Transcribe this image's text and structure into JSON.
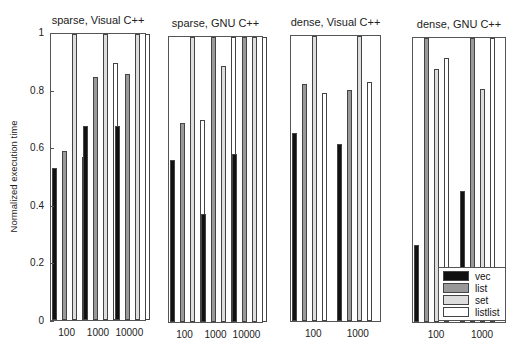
{
  "chart_data": [
    {
      "type": "bar",
      "title": "sparse, Visual C++",
      "ylabel": "Normalized execution time",
      "ylim": [
        0,
        1
      ],
      "yticks": [
        "0",
        "0.2",
        "0.4",
        "0.6",
        "0.8",
        "1"
      ],
      "categories": [
        "100",
        "1000",
        "10000"
      ],
      "series": [
        {
          "name": "vec",
          "values": [
            0.53,
            0.68,
            0.68
          ]
        },
        {
          "name": "list",
          "values": [
            0.59,
            0.85,
            0.86
          ]
        },
        {
          "name": "set",
          "values": [
            1.0,
            1.0,
            1.0
          ]
        },
        {
          "name": "listlist",
          "values": [
            0.57,
            0.9,
            1.0
          ]
        }
      ]
    },
    {
      "type": "bar",
      "title": "sparse, GNU C++",
      "ylim": [
        0,
        1
      ],
      "categories": [
        "100",
        "1000",
        "10000"
      ],
      "series": [
        {
          "name": "vec",
          "values": [
            0.57,
            0.38,
            0.59
          ]
        },
        {
          "name": "list",
          "values": [
            0.7,
            1.0,
            1.0
          ]
        },
        {
          "name": "set",
          "values": [
            1.0,
            0.9,
            1.0
          ]
        },
        {
          "name": "listlist",
          "values": [
            0.71,
            1.0,
            1.0
          ]
        }
      ]
    },
    {
      "type": "bar",
      "title": "dense, Visual C++",
      "ylim": [
        0,
        1
      ],
      "categories": [
        "100",
        "1000"
      ],
      "series": [
        {
          "name": "vec",
          "values": [
            0.66,
            0.62
          ]
        },
        {
          "name": "list",
          "values": [
            0.83,
            0.81
          ]
        },
        {
          "name": "set",
          "values": [
            1.0,
            1.0
          ]
        },
        {
          "name": "listlist",
          "values": [
            0.8,
            0.84
          ]
        }
      ]
    },
    {
      "type": "bar",
      "title": "dense, GNU C++",
      "ylim": [
        0,
        1
      ],
      "categories": [
        "100",
        "1000"
      ],
      "series": [
        {
          "name": "vec",
          "values": [
            0.27,
            0.46
          ]
        },
        {
          "name": "list",
          "values": [
            1.0,
            1.0
          ]
        },
        {
          "name": "set",
          "values": [
            0.89,
            0.82
          ]
        },
        {
          "name": "listlist",
          "values": [
            0.93,
            1.0
          ]
        }
      ],
      "legend": {
        "position": "lower right",
        "entries": [
          "vec",
          "list",
          "set",
          "listlist"
        ]
      }
    }
  ],
  "colors": {
    "vec": "#111111",
    "list": "#999999",
    "set": "#dddddd",
    "listlist": "#ffffff"
  },
  "layout": {
    "panels": [
      {
        "left": 50,
        "top": 33,
        "width": 96,
        "height": 288,
        "title_y": 14
      },
      {
        "left": 168,
        "top": 36,
        "width": 95,
        "height": 287,
        "title_y": 17
      },
      {
        "left": 290,
        "top": 35,
        "width": 91,
        "height": 287,
        "title_y": 16
      },
      {
        "left": 412,
        "top": 37,
        "width": 94,
        "height": 286,
        "title_y": 18
      }
    ]
  }
}
